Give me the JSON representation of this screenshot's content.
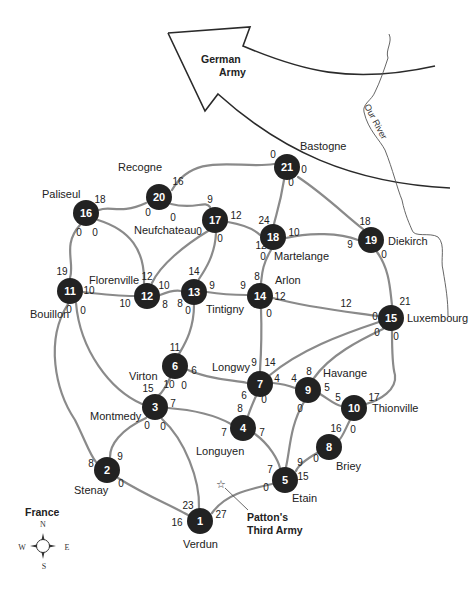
{
  "map": {
    "arrow_label": [
      "German",
      "Army"
    ],
    "river_label": "Our River",
    "army_label": [
      "Patton's",
      "Third Army"
    ],
    "country_label": "France",
    "compass": {
      "n": "N",
      "s": "S",
      "e": "E",
      "w": "W"
    },
    "colors": {
      "node": "#222222",
      "road": "#8a8a8a",
      "text": "#222222"
    }
  },
  "nodes": [
    {
      "id": "1",
      "x": 200,
      "y": 521,
      "city": "Verdun",
      "lx": 183,
      "ly": 548
    },
    {
      "id": "2",
      "x": 107,
      "y": 470,
      "city": "Stenay",
      "lx": 74,
      "ly": 494
    },
    {
      "id": "3",
      "x": 155,
      "y": 407,
      "city": "Montmedy",
      "lx": 90,
      "ly": 420
    },
    {
      "id": "4",
      "x": 243,
      "y": 428,
      "city": "Longuyen",
      "lx": 196,
      "ly": 455
    },
    {
      "id": "5",
      "x": 285,
      "y": 480,
      "city": "Etain",
      "lx": 292,
      "ly": 502
    },
    {
      "id": "6",
      "x": 175,
      "y": 366,
      "city": "Virton",
      "lx": 129,
      "ly": 380
    },
    {
      "id": "7",
      "x": 260,
      "y": 384,
      "city": "Longwy",
      "lx": 212,
      "ly": 371
    },
    {
      "id": "8",
      "x": 329,
      "y": 447,
      "city": "Briey",
      "lx": 336,
      "ly": 470
    },
    {
      "id": "9",
      "x": 308,
      "y": 390,
      "city": "Havange",
      "lx": 323,
      "ly": 377
    },
    {
      "id": "10",
      "x": 354,
      "y": 408,
      "city": "Thionville",
      "lx": 372,
      "ly": 412
    },
    {
      "id": "11",
      "x": 70,
      "y": 291,
      "city": "Bouillon",
      "lx": 30,
      "ly": 318
    },
    {
      "id": "12",
      "x": 147,
      "y": 296,
      "city": "Florenville",
      "lx": 89,
      "ly": 284
    },
    {
      "id": "13",
      "x": 194,
      "y": 292,
      "city": "Tintigny",
      "lx": 206,
      "ly": 313
    },
    {
      "id": "14",
      "x": 260,
      "y": 296,
      "city": "Arlon",
      "lx": 275,
      "ly": 284
    },
    {
      "id": "15",
      "x": 391,
      "y": 318,
      "city": "Luxembourg",
      "lx": 407,
      "ly": 322
    },
    {
      "id": "16",
      "x": 86,
      "y": 213,
      "city": "Paliseul",
      "lx": 42,
      "ly": 198
    },
    {
      "id": "17",
      "x": 215,
      "y": 220,
      "city": "Neufchateau",
      "lx": 134,
      "ly": 234
    },
    {
      "id": "18",
      "x": 273,
      "y": 237,
      "city": "Martelange",
      "lx": 274,
      "ly": 260
    },
    {
      "id": "19",
      "x": 371,
      "y": 240,
      "city": "Diekirch",
      "lx": 388,
      "ly": 245
    },
    {
      "id": "20",
      "x": 159,
      "y": 197,
      "city": "Recogne",
      "lx": 118,
      "ly": 171
    },
    {
      "id": "21",
      "x": 287,
      "y": 167,
      "city": "Bastogne",
      "lx": 300,
      "ly": 150
    }
  ],
  "edges": [
    {
      "from": "20",
      "to": "21",
      "d": "M172,190 C195,150 240,170 274,164"
    },
    {
      "from": "20",
      "to": "16",
      "d": "M146,203 C120,215 110,205 99,210"
    },
    {
      "from": "20",
      "to": "17",
      "d": "M171,204 C195,210 205,200 210,207"
    },
    {
      "from": "21",
      "to": "18",
      "d": "M284,180 C280,205 276,215 274,224"
    },
    {
      "from": "21",
      "to": "19",
      "d": "M298,177 C325,195 345,215 363,229"
    },
    {
      "from": "16",
      "to": "11",
      "d": "M80,225 C62,245 75,262 70,278"
    },
    {
      "from": "16",
      "to": "12",
      "d": "M98,220 C130,230 145,250 144,283"
    },
    {
      "from": "17",
      "to": "12",
      "d": "M208,231 C185,245 160,265 152,283"
    },
    {
      "from": "17",
      "to": "13",
      "d": "M216,233 C215,255 205,270 199,279"
    },
    {
      "from": "17",
      "to": "18",
      "d": "M228,222 C245,225 255,230 260,235"
    },
    {
      "from": "18",
      "to": "19",
      "d": "M286,238 C310,232 340,233 358,240"
    },
    {
      "from": "18",
      "to": "14",
      "d": "M271,250 C262,265 262,275 261,283"
    },
    {
      "from": "19",
      "to": "15",
      "d": "M377,252 C390,270 390,290 392,305"
    },
    {
      "from": "11",
      "to": "12",
      "d": "M83,292 C100,294 120,296 134,296"
    },
    {
      "from": "12",
      "to": "13",
      "d": "M160,295 C170,291 176,290 181,291"
    },
    {
      "from": "13",
      "to": "14",
      "d": "M207,292 C225,295 240,295 247,295"
    },
    {
      "from": "14",
      "to": "15",
      "d": "M273,298 C310,308 350,312 378,316"
    },
    {
      "from": "14",
      "to": "7",
      "d": "M261,309 C262,335 261,355 260,371"
    },
    {
      "from": "13",
      "to": "6",
      "d": "M194,305 C194,330 184,345 179,354"
    },
    {
      "from": "11",
      "to": "3",
      "d": "M76,303 C80,350 110,390 142,404"
    },
    {
      "from": "11",
      "to": "2",
      "d": "M68,304 C45,340 55,390 75,420 C85,440 90,455 96,462"
    },
    {
      "from": "6",
      "to": "3",
      "d": "M170,378 C165,388 162,393 159,395"
    },
    {
      "from": "6",
      "to": "7",
      "d": "M188,370 C210,380 235,380 247,383"
    },
    {
      "from": "3",
      "to": "4",
      "d": "M168,408 C195,410 215,415 231,424"
    },
    {
      "from": "3",
      "to": "2",
      "d": "M146,418 C120,430 110,445 110,457"
    },
    {
      "from": "3",
      "to": "1",
      "d": "M162,419 C185,440 200,480 199,508"
    },
    {
      "from": "7",
      "to": "4",
      "d": "M256,396 C252,405 250,410 248,416"
    },
    {
      "from": "7",
      "to": "9",
      "d": "M273,383 C285,384 290,386 295,388"
    },
    {
      "from": "7",
      "to": "15",
      "d": "M270,375 C300,350 340,335 379,322"
    },
    {
      "from": "9",
      "to": "15",
      "d": "M314,378 C330,355 360,340 383,329"
    },
    {
      "from": "9",
      "to": "10",
      "d": "M320,394 C330,400 335,405 341,406"
    },
    {
      "from": "9",
      "to": "5",
      "d": "M304,402 C290,425 290,450 286,467"
    },
    {
      "from": "15",
      "to": "10",
      "d": "M392,331 C392,350 392,365 395,375 C397,390 380,400 366,404"
    },
    {
      "from": "10",
      "to": "8",
      "d": "M350,420 C345,430 342,438 339,440"
    },
    {
      "from": "8",
      "to": "5",
      "d": "M317,453 C305,460 298,466 296,471"
    },
    {
      "from": "4",
      "to": "5",
      "d": "M255,434 C270,445 278,460 280,468"
    },
    {
      "from": "2",
      "to": "1",
      "d": "M118,478 C145,495 170,505 188,515"
    },
    {
      "from": "5",
      "to": "1",
      "d": "M272,484 C245,490 225,495 212,513"
    }
  ],
  "weights": [
    {
      "x": 178,
      "y": 181,
      "t": "16"
    },
    {
      "x": 148,
      "y": 212,
      "t": "0"
    },
    {
      "x": 173,
      "y": 217,
      "t": "0"
    },
    {
      "x": 273,
      "y": 154,
      "t": "0"
    },
    {
      "x": 304,
      "y": 169,
      "t": "0"
    },
    {
      "x": 291,
      "y": 182,
      "t": "0"
    },
    {
      "x": 100,
      "y": 199,
      "t": "18"
    },
    {
      "x": 79,
      "y": 232,
      "t": "0"
    },
    {
      "x": 95,
      "y": 232,
      "t": "0"
    },
    {
      "x": 210,
      "y": 199,
      "t": "9"
    },
    {
      "x": 236,
      "y": 215,
      "t": "12"
    },
    {
      "x": 199,
      "y": 231,
      "t": "0"
    },
    {
      "x": 220,
      "y": 238,
      "t": "0"
    },
    {
      "x": 264,
      "y": 220,
      "t": "24"
    },
    {
      "x": 261,
      "y": 245,
      "t": "12"
    },
    {
      "x": 263,
      "y": 256,
      "t": "0"
    },
    {
      "x": 294,
      "y": 232,
      "t": "10"
    },
    {
      "x": 365,
      "y": 221,
      "t": "18"
    },
    {
      "x": 350,
      "y": 244,
      "t": "9"
    },
    {
      "x": 384,
      "y": 254,
      "t": "0"
    },
    {
      "x": 62,
      "y": 271,
      "t": "19"
    },
    {
      "x": 89,
      "y": 290,
      "t": "10"
    },
    {
      "x": 69,
      "y": 309,
      "t": "0"
    },
    {
      "x": 83,
      "y": 310,
      "t": "0"
    },
    {
      "x": 125,
      "y": 303,
      "t": "10"
    },
    {
      "x": 147,
      "y": 276,
      "t": "12"
    },
    {
      "x": 164,
      "y": 285,
      "t": "10"
    },
    {
      "x": 165,
      "y": 304,
      "t": "8"
    },
    {
      "x": 180,
      "y": 303,
      "t": "8"
    },
    {
      "x": 194,
      "y": 271,
      "t": "14"
    },
    {
      "x": 212,
      "y": 285,
      "t": "9"
    },
    {
      "x": 188,
      "y": 310,
      "t": "0"
    },
    {
      "x": 243,
      "y": 285,
      "t": "9"
    },
    {
      "x": 257,
      "y": 276,
      "t": "8"
    },
    {
      "x": 280,
      "y": 296,
      "t": "12"
    },
    {
      "x": 269,
      "y": 313,
      "t": "0"
    },
    {
      "x": 346,
      "y": 303,
      "t": "12"
    },
    {
      "x": 375,
      "y": 316,
      "t": "0"
    },
    {
      "x": 377,
      "y": 332,
      "t": "0"
    },
    {
      "x": 396,
      "y": 336,
      "t": "0"
    },
    {
      "x": 405,
      "y": 301,
      "t": "21"
    },
    {
      "x": 175,
      "y": 347,
      "t": "11"
    },
    {
      "x": 194,
      "y": 370,
      "t": "6"
    },
    {
      "x": 169,
      "y": 384,
      "t": "10"
    },
    {
      "x": 148,
      "y": 388,
      "t": "15"
    },
    {
      "x": 173,
      "y": 403,
      "t": "7"
    },
    {
      "x": 184,
      "y": 385,
      "t": "0"
    },
    {
      "x": 147,
      "y": 425,
      "t": "0"
    },
    {
      "x": 163,
      "y": 426,
      "t": "0"
    },
    {
      "x": 254,
      "y": 362,
      "t": "9"
    },
    {
      "x": 270,
      "y": 362,
      "t": "14"
    },
    {
      "x": 277,
      "y": 378,
      "t": "4"
    },
    {
      "x": 294,
      "y": 378,
      "t": "4"
    },
    {
      "x": 244,
      "y": 395,
      "t": "6"
    },
    {
      "x": 264,
      "y": 399,
      "t": "0"
    },
    {
      "x": 240,
      "y": 408,
      "t": "8"
    },
    {
      "x": 224,
      "y": 432,
      "t": "7"
    },
    {
      "x": 262,
      "y": 432,
      "t": "7"
    },
    {
      "x": 309,
      "y": 371,
      "t": "8"
    },
    {
      "x": 327,
      "y": 387,
      "t": "5"
    },
    {
      "x": 338,
      "y": 397,
      "t": "5"
    },
    {
      "x": 300,
      "y": 408,
      "t": "0"
    },
    {
      "x": 374,
      "y": 397,
      "t": "17"
    },
    {
      "x": 336,
      "y": 428,
      "t": "16"
    },
    {
      "x": 353,
      "y": 429,
      "t": "0"
    },
    {
      "x": 316,
      "y": 458,
      "t": "0"
    },
    {
      "x": 300,
      "y": 462,
      "t": "9"
    },
    {
      "x": 303,
      "y": 476,
      "t": "15"
    },
    {
      "x": 270,
      "y": 469,
      "t": "7"
    },
    {
      "x": 266,
      "y": 487,
      "t": "0"
    },
    {
      "x": 120,
      "y": 456,
      "t": "9"
    },
    {
      "x": 91,
      "y": 463,
      "t": "8"
    },
    {
      "x": 121,
      "y": 483,
      "t": "0"
    },
    {
      "x": 188,
      "y": 505,
      "t": "23"
    },
    {
      "x": 177,
      "y": 522,
      "t": "16"
    },
    {
      "x": 221,
      "y": 514,
      "t": "27"
    }
  ],
  "chart_data": {
    "type": "network",
    "title": "",
    "nodes": [
      {
        "id": 1,
        "name": "Verdun"
      },
      {
        "id": 2,
        "name": "Stenay"
      },
      {
        "id": 3,
        "name": "Montmedy"
      },
      {
        "id": 4,
        "name": "Longuyen"
      },
      {
        "id": 5,
        "name": "Etain"
      },
      {
        "id": 6,
        "name": "Virton"
      },
      {
        "id": 7,
        "name": "Longwy"
      },
      {
        "id": 8,
        "name": "Briey"
      },
      {
        "id": 9,
        "name": "Havange"
      },
      {
        "id": 10,
        "name": "Thionville"
      },
      {
        "id": 11,
        "name": "Bouillon"
      },
      {
        "id": 12,
        "name": "Florenville"
      },
      {
        "id": 13,
        "name": "Tintigny"
      },
      {
        "id": 14,
        "name": "Arlon"
      },
      {
        "id": 15,
        "name": "Luxembourg"
      },
      {
        "id": 16,
        "name": "Paliseul"
      },
      {
        "id": 17,
        "name": "Neufchateau"
      },
      {
        "id": 18,
        "name": "Martelange"
      },
      {
        "id": 19,
        "name": "Diekirch"
      },
      {
        "id": 20,
        "name": "Recogne"
      },
      {
        "id": 21,
        "name": "Bastogne"
      }
    ],
    "annotations": [
      "German Army",
      "Our River",
      "Patton's Third Army",
      "France"
    ]
  }
}
